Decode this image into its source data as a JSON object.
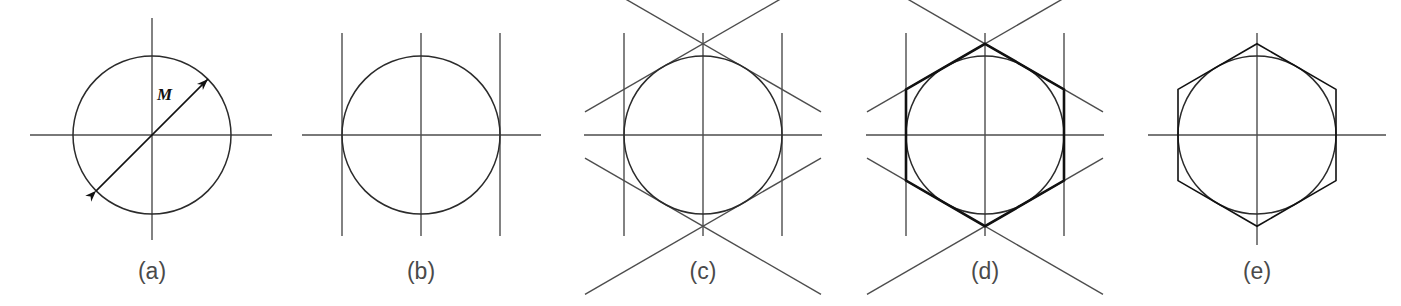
{
  "figure": {
    "kind": "geometric-construction-sequence",
    "background_color": "#ffffff",
    "stroke_color_construction": "#4d4d4d",
    "stroke_color_circle": "#2b2b2b",
    "stroke_color_final": "#111111",
    "caption_color": "#4a4a4a"
  },
  "geometry": {
    "circle_radius": 79,
    "center_y": 135,
    "panel_centers_x": [
      152,
      421,
      703,
      985,
      1257
    ],
    "caption_y": 258,
    "vertical_tangent_offset": 79,
    "diagonal_slope_degrees": 30
  },
  "panels": [
    {
      "id": "a",
      "caption": "(a)",
      "center_x": 152,
      "elements": [
        "circle",
        "horizontal-axis",
        "vertical-axis",
        "diameter-dimension-line"
      ],
      "dimension_label": "M",
      "dimension_label_x": 157,
      "dimension_label_y": 85,
      "axis_h_x1": 30,
      "axis_h_x2": 272,
      "axis_v_y1": 18,
      "axis_v_y2": 240,
      "has_vertical_tangents": false,
      "has_diagonals": false,
      "has_hexagon": false,
      "hexagon_style": "none"
    },
    {
      "id": "b",
      "caption": "(b)",
      "center_x": 421,
      "elements": [
        "circle",
        "horizontal-axis",
        "vertical-axis",
        "vertical-tangent-left",
        "vertical-tangent-right"
      ],
      "dimension_label": "",
      "axis_h_x1": 302,
      "axis_h_x2": 541,
      "axis_v_y1": 33,
      "axis_v_y2": 236,
      "has_vertical_tangents": true,
      "has_diagonals": false,
      "has_hexagon": false,
      "hexagon_style": "none"
    },
    {
      "id": "c",
      "caption": "(c)",
      "center_x": 703,
      "elements": [
        "circle",
        "horizontal-axis",
        "vertical-axis",
        "vertical-tangent-left",
        "vertical-tangent-right",
        "diagonal-tangent-upper-left",
        "diagonal-tangent-upper-right",
        "diagonal-tangent-lower-left",
        "diagonal-tangent-lower-right"
      ],
      "dimension_label": "",
      "axis_h_x1": 584,
      "axis_h_x2": 822,
      "axis_v_y1": 33,
      "axis_v_y2": 236,
      "has_vertical_tangents": true,
      "has_diagonals": true,
      "has_hexagon": false,
      "hexagon_style": "none"
    },
    {
      "id": "d",
      "caption": "(d)",
      "center_x": 985,
      "elements": [
        "circle",
        "horizontal-axis",
        "vertical-axis",
        "vertical-tangent-left",
        "vertical-tangent-right",
        "diagonal-tangent-upper-left",
        "diagonal-tangent-upper-right",
        "diagonal-tangent-lower-left",
        "diagonal-tangent-lower-right",
        "hexagon-outline"
      ],
      "dimension_label": "",
      "axis_h_x1": 866,
      "axis_h_x2": 1104,
      "axis_v_y1": 33,
      "axis_v_y2": 236,
      "has_vertical_tangents": true,
      "has_diagonals": true,
      "has_hexagon": true,
      "hexagon_style": "bold"
    },
    {
      "id": "e",
      "caption": "(e)",
      "center_x": 1257,
      "elements": [
        "circle",
        "horizontal-axis",
        "vertical-axis",
        "hexagon-outline"
      ],
      "dimension_label": "",
      "axis_h_x1": 1148,
      "axis_h_x2": 1386,
      "axis_v_y1": 33,
      "axis_v_y2": 245,
      "has_vertical_tangents": false,
      "has_diagonals": false,
      "has_hexagon": true,
      "hexagon_style": "final"
    }
  ]
}
